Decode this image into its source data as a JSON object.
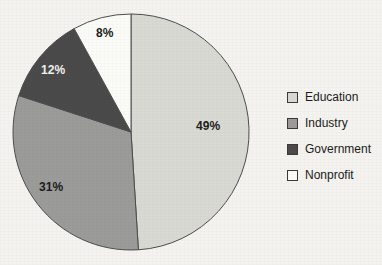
{
  "chart_data": {
    "type": "pie",
    "title": "",
    "labels": [
      "Education",
      "Industry",
      "Government",
      "Nonprofit"
    ],
    "values": [
      49,
      31,
      12,
      8
    ],
    "value_labels": [
      "49%",
      "31%",
      "12%",
      "8%"
    ],
    "units": "percent",
    "start_angle_deg": 0,
    "direction": "clockwise",
    "legend_position": "right",
    "grid": false,
    "colors": [
      "#d9d9d4",
      "#9b9b9a",
      "#4a4a4a",
      "#fbfbf8"
    ],
    "slices": [
      {
        "label": "Education",
        "value": 49,
        "value_label": "49%",
        "color": "#d9d9d4",
        "label_color": "#1d1d1d",
        "label_x": 196,
        "label_y": 119
      },
      {
        "label": "Industry",
        "value": 31,
        "value_label": "31%",
        "color": "#9b9b9a",
        "label_color": "#1d1d1d",
        "label_x": 39,
        "label_y": 180
      },
      {
        "label": "Government",
        "value": 12,
        "value_label": "12%",
        "color": "#4a4a4a",
        "label_color": "#f2f1ed",
        "label_x": 41,
        "label_y": 63
      },
      {
        "label": "Nonprofit",
        "value": 8,
        "value_label": "8%",
        "color": "#fbfbf8",
        "label_color": "#1d1d1d",
        "label_x": 96,
        "label_y": 26
      }
    ]
  },
  "legend": {
    "items": [
      {
        "label": "Education",
        "color": "#d9d9d4"
      },
      {
        "label": "Industry",
        "color": "#9b9b9a"
      },
      {
        "label": "Government",
        "color": "#4a4a4a"
      },
      {
        "label": "Nonprofit",
        "color": "#fbfbf8"
      }
    ]
  },
  "geometry": {
    "center_x": 131,
    "center_y": 132,
    "radius": 118,
    "outline_color": "#4d4d4d"
  }
}
